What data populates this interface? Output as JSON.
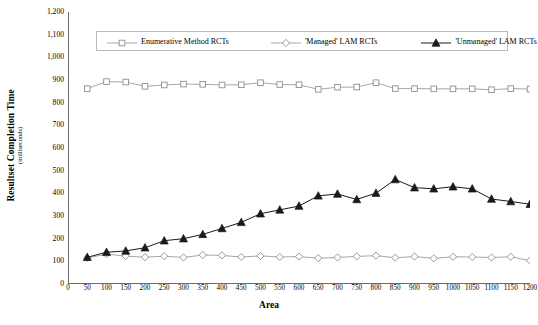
{
  "chart_data": {
    "type": "line",
    "title": "",
    "xlabel": "Area",
    "ylabel": "Resultset Completion Time",
    "ylabel_units": "(milliseconds)",
    "xlim": [
      0,
      1200
    ],
    "ylim": [
      0,
      1200
    ],
    "ytick_step": 100,
    "xtick_step": 50,
    "grid": false,
    "legend_position": "top-center",
    "x": [
      50,
      100,
      150,
      200,
      250,
      300,
      350,
      400,
      450,
      500,
      550,
      600,
      650,
      700,
      750,
      800,
      850,
      900,
      950,
      1000,
      1050,
      1100,
      1150,
      1200
    ],
    "xticklabels": [
      "0",
      "50",
      "100",
      "150",
      "200",
      "250",
      "300",
      "350",
      "400",
      "450",
      "500",
      "550",
      "600",
      "650",
      "700",
      "750",
      "800",
      "850",
      "900",
      "950",
      "1000",
      "1050",
      "1100",
      "1150",
      "1200"
    ],
    "yticklabels": [
      "0",
      "100",
      "200",
      "300",
      "400",
      "500",
      "600",
      "700",
      "800",
      "900",
      "1,000",
      "1,100",
      "1,200"
    ],
    "series": [
      {
        "name": "Enumerative Method RCTs",
        "marker": "open-square",
        "color": "#8f8f8f",
        "values": [
          862,
          893,
          891,
          872,
          878,
          882,
          881,
          878,
          879,
          888,
          880,
          879,
          859,
          868,
          869,
          888,
          862,
          862,
          861,
          861,
          861,
          857,
          862,
          860
        ]
      },
      {
        "name": "'Managed' LAM RCTs",
        "marker": "open-diamond",
        "color": "#8f8f8f",
        "values": [
          115,
          132,
          123,
          118,
          123,
          117,
          128,
          126,
          119,
          124,
          119,
          121,
          114,
          117,
          122,
          125,
          116,
          121,
          113,
          120,
          119,
          117,
          120,
          103
        ]
      },
      {
        "name": "'Unmanaged' LAM RCTs",
        "marker": "filled-triangle",
        "color": "#1a1a1a",
        "values": [
          118,
          140,
          146,
          160,
          191,
          200,
          219,
          245,
          272,
          310,
          327,
          344,
          389,
          397,
          373,
          401,
          461,
          425,
          420,
          429,
          420,
          375,
          364,
          352
        ]
      }
    ]
  },
  "legend": {
    "items": [
      {
        "label": "Enumerative Method RCTs"
      },
      {
        "label": "'Managed' LAM RCTs"
      },
      {
        "label": "'Unmanaged' LAM RCTs"
      }
    ]
  }
}
